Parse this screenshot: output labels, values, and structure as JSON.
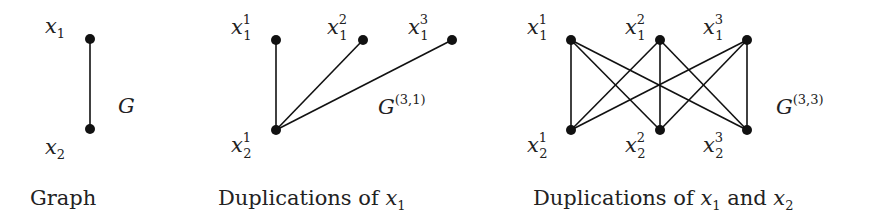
{
  "panels": [
    {
      "id": "graph",
      "caption": {
        "text": "Graph",
        "var": "",
        "var_sub": "",
        "joiner": "",
        "var2": "",
        "var2_sub": ""
      },
      "graph_label": {
        "base": "G",
        "sup": ""
      },
      "nodes": [
        {
          "id": "x1",
          "base": "x",
          "sub": "1",
          "sup": "",
          "x": 90,
          "y": 39
        },
        {
          "id": "x2",
          "base": "x",
          "sub": "2",
          "sup": "",
          "x": 90,
          "y": 129
        }
      ],
      "edges": [
        [
          "x1",
          "x2"
        ]
      ]
    },
    {
      "id": "dup-x1",
      "caption": {
        "text": "Duplications of ",
        "var": "x",
        "var_sub": "1",
        "joiner": "",
        "var2": "",
        "var2_sub": ""
      },
      "graph_label": {
        "base": "G",
        "sup": "(3,1)"
      },
      "nodes": [
        {
          "id": "x1_1",
          "base": "x",
          "sub": "1",
          "sup": "1",
          "x": 276,
          "y": 40
        },
        {
          "id": "x1_2",
          "base": "x",
          "sub": "1",
          "sup": "2",
          "x": 363,
          "y": 40
        },
        {
          "id": "x1_3",
          "base": "x",
          "sub": "1",
          "sup": "3",
          "x": 452,
          "y": 40
        },
        {
          "id": "x2_1",
          "base": "x",
          "sub": "2",
          "sup": "1",
          "x": 276,
          "y": 130
        }
      ],
      "edges": [
        [
          "x1_1",
          "x2_1"
        ],
        [
          "x1_2",
          "x2_1"
        ],
        [
          "x1_3",
          "x2_1"
        ]
      ]
    },
    {
      "id": "dup-x1-x2",
      "caption": {
        "text": "Duplications of ",
        "var": "x",
        "var_sub": "1",
        "joiner": " and ",
        "var2": "x",
        "var2_sub": "2"
      },
      "graph_label": {
        "base": "G",
        "sup": "(3,3)"
      },
      "nodes": [
        {
          "id": "x1_1",
          "base": "x",
          "sub": "1",
          "sup": "1",
          "x": 571,
          "y": 40
        },
        {
          "id": "x1_2",
          "base": "x",
          "sub": "1",
          "sup": "2",
          "x": 660,
          "y": 40
        },
        {
          "id": "x1_3",
          "base": "x",
          "sub": "1",
          "sup": "3",
          "x": 747,
          "y": 40
        },
        {
          "id": "x2_1",
          "base": "x",
          "sub": "2",
          "sup": "1",
          "x": 571,
          "y": 130
        },
        {
          "id": "x2_2",
          "base": "x",
          "sub": "2",
          "sup": "2",
          "x": 660,
          "y": 130
        },
        {
          "id": "x2_3",
          "base": "x",
          "sub": "2",
          "sup": "3",
          "x": 747,
          "y": 130
        }
      ],
      "edges": [
        [
          "x1_1",
          "x2_1"
        ],
        [
          "x1_1",
          "x2_2"
        ],
        [
          "x1_1",
          "x2_3"
        ],
        [
          "x1_2",
          "x2_1"
        ],
        [
          "x1_2",
          "x2_2"
        ],
        [
          "x1_2",
          "x2_3"
        ],
        [
          "x1_3",
          "x2_1"
        ],
        [
          "x1_3",
          "x2_2"
        ],
        [
          "x1_3",
          "x2_3"
        ]
      ]
    }
  ]
}
